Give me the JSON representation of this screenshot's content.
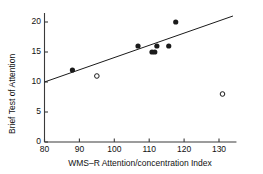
{
  "chart_data": {
    "type": "scatter",
    "title": "",
    "xlabel": "WMS–R Attention/concentration Index",
    "ylabel": "Brief Test of Attention",
    "xlim": [
      80,
      135
    ],
    "ylim": [
      0,
      21.5
    ],
    "xticks": [
      80,
      90,
      100,
      110,
      120,
      130
    ],
    "yticks": [
      0,
      5,
      10,
      15,
      20
    ],
    "xtick_labels": [
      "80",
      "90",
      "100",
      "110",
      "120",
      "130"
    ],
    "ytick_labels": [
      "0",
      "5",
      "10",
      "15",
      "20"
    ],
    "grid": false,
    "legend": "none",
    "series": [
      {
        "name": "filled",
        "marker": "filled-circle",
        "color": "#1a1a1a",
        "points": [
          {
            "x": 88.0,
            "y": 12
          },
          {
            "x": 106.8,
            "y": 16
          },
          {
            "x": 110.8,
            "y": 15
          },
          {
            "x": 111.6,
            "y": 15
          },
          {
            "x": 112.2,
            "y": 16
          },
          {
            "x": 115.6,
            "y": 16
          },
          {
            "x": 117.6,
            "y": 20
          }
        ]
      },
      {
        "name": "open",
        "marker": "open-circle",
        "color": "#1a1a1a",
        "points": [
          {
            "x": 95.0,
            "y": 11
          },
          {
            "x": 131.0,
            "y": 8
          }
        ]
      }
    ],
    "fit_line": {
      "name": "regression-line",
      "color": "#1a1a1a",
      "x_start": 80.0,
      "y_start": 10.0,
      "x_end": 134.0,
      "y_end": 21.0
    }
  }
}
